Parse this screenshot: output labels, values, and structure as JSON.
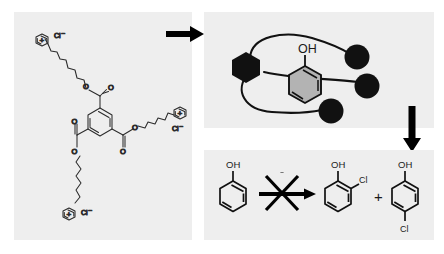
{
  "figure": {
    "background_color": "#ffffff",
    "panel_background": "#eeeeee",
    "ink_color": "#1a1a1a",
    "ring_fill_color": "#b3b3b3"
  },
  "panels": {
    "left": {
      "name": "tripodal-receptor-structure",
      "x": 14,
      "y": 12,
      "w": 178,
      "h": 228,
      "description": "Benzene-1,3,5-tricarboxylate core with three long alkyl ester arms each terminating in a pyridinium chloride",
      "core_label": "benzene-1,3,5-tricarboxylate",
      "arms": [
        {
          "id": "arm-top-left",
          "cation": "+",
          "counterion": "Cl−"
        },
        {
          "id": "arm-right",
          "cation": "+",
          "counterion": "Cl−"
        },
        {
          "id": "arm-bottom",
          "cation": "+",
          "counterion": "Cl−"
        }
      ],
      "labels": {
        "plus_charge": "+",
        "chloride": "Cl−",
        "chloride_display": "Cl",
        "chloride_superscript": "–",
        "oxygen": "O"
      }
    },
    "top_right": {
      "name": "host-guest-schematic",
      "x": 204,
      "y": 12,
      "w": 230,
      "h": 116,
      "description": "Cartoon of the tripodal host (black hexagon core, three curved arms with black sphere head groups) encapsulating a phenol guest",
      "guest_label": "OH",
      "guest_name": "phenol",
      "core_shape": "black-hexagon",
      "arm_count": 3,
      "head_group_shape": "filled-circle"
    },
    "bottom_right": {
      "name": "blocked-chlorination-reaction",
      "x": 204,
      "y": 150,
      "w": 230,
      "h": 90,
      "description": "Phenol chlorination crossed out: no 2-chlorophenol or 4-chlorophenol formed",
      "reaction_blocked": true,
      "reactant": {
        "name": "phenol",
        "oh_label": "OH"
      },
      "plus_sign": "+",
      "products": [
        {
          "name": "2-chlorophenol",
          "oh_label": "OH",
          "cl_label": "Cl",
          "position": "ortho"
        },
        {
          "name": "4-chlorophenol",
          "oh_label": "OH",
          "cl_label": "Cl",
          "position": "para"
        }
      ]
    }
  },
  "arrows": [
    {
      "name": "arrow-left-to-schematic",
      "direction": "right",
      "x": 168,
      "y": 33,
      "length": 36
    },
    {
      "name": "arrow-schematic-to-reaction",
      "direction": "down",
      "x": 411,
      "y": 108,
      "length": 44
    }
  ]
}
